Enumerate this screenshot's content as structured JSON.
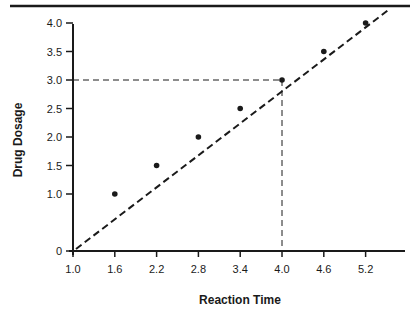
{
  "chart_data": {
    "type": "line",
    "title": "",
    "xlabel": "Reaction Time",
    "ylabel": "Drug Dosage",
    "x_ticks": [
      "1.0",
      "1.6",
      "2.2",
      "2.8",
      "3.4",
      "4.0",
      "4.6",
      "5.2"
    ],
    "y_ticks": [
      "0",
      "1.0",
      "1.5",
      "2.0",
      "2.5",
      "3.0",
      "3.5",
      "4.0"
    ],
    "xlim": [
      1.0,
      5.55
    ],
    "ylim": [
      0,
      4.5
    ],
    "grid": false,
    "legend": null,
    "series": [
      {
        "name": "Drug Dosage vs Reaction Time",
        "style": "dashed",
        "markers": true,
        "x": [
          1.6,
          2.2,
          2.8,
          3.4,
          4.0,
          4.6,
          5.2
        ],
        "y": [
          1.0,
          1.5,
          2.0,
          2.5,
          3.0,
          3.5,
          4.0
        ]
      }
    ],
    "trend_line": {
      "from": [
        1.0,
        0.0
      ],
      "to": [
        5.55,
        4.25
      ],
      "style": "dashed"
    },
    "annotations": [
      {
        "type": "guide-lines",
        "style": "dashed",
        "point": [
          4.0,
          3.0
        ],
        "description": "Dashed lines from y-axis at 3.0 to point and down to x-axis at 4.0"
      }
    ]
  },
  "colors": {
    "ink": "#1a1a1a",
    "background": "#ffffff"
  }
}
